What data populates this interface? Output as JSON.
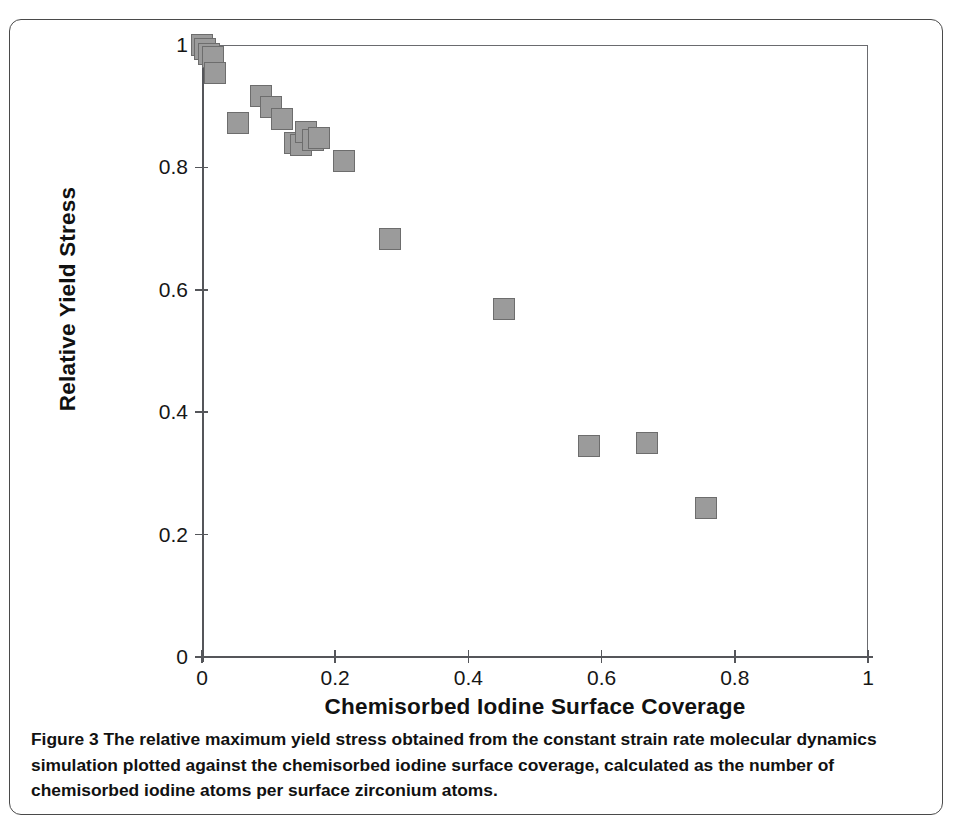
{
  "figure": {
    "caption_label": "Figure 3",
    "caption_text": "The relative maximum yield stress obtained from the constant strain rate molecular dynamics simulation plotted against the chemisorbed iodine surface coverage, calculated as the number of chemisorbed iodine atoms per surface zirconium atoms."
  },
  "chart_data": {
    "type": "scatter",
    "title": "",
    "xlabel": "Chemisorbed Iodine Surface Coverage",
    "ylabel": "Relative Yield Stress",
    "xlim": [
      0,
      1
    ],
    "ylim": [
      0,
      1
    ],
    "xticks": [
      "0",
      "0.2",
      "0.4",
      "0.6",
      "0.8",
      "1"
    ],
    "xtick_values": [
      0,
      0.2,
      0.4,
      0.6,
      0.8,
      1
    ],
    "yticks": [
      "0",
      "0.2",
      "0.4",
      "0.6",
      "0.8",
      "1"
    ],
    "ytick_values": [
      0,
      0.2,
      0.4,
      0.6,
      0.8,
      1
    ],
    "grid": false,
    "legend": "none",
    "marker": "square",
    "marker_color": "#9b9b9b",
    "marker_edge_color": "#6d6d6d",
    "series": [
      {
        "name": "Relative yield stress vs coverage",
        "points": [
          {
            "x": 0.0,
            "y": 1.0
          },
          {
            "x": 0.004,
            "y": 0.993
          },
          {
            "x": 0.01,
            "y": 0.985
          },
          {
            "x": 0.016,
            "y": 0.98
          },
          {
            "x": 0.019,
            "y": 0.955
          },
          {
            "x": 0.054,
            "y": 0.872
          },
          {
            "x": 0.088,
            "y": 0.917
          },
          {
            "x": 0.104,
            "y": 0.898
          },
          {
            "x": 0.12,
            "y": 0.879
          },
          {
            "x": 0.14,
            "y": 0.84
          },
          {
            "x": 0.148,
            "y": 0.836
          },
          {
            "x": 0.156,
            "y": 0.858
          },
          {
            "x": 0.166,
            "y": 0.845
          },
          {
            "x": 0.176,
            "y": 0.848
          },
          {
            "x": 0.213,
            "y": 0.81
          },
          {
            "x": 0.282,
            "y": 0.683
          },
          {
            "x": 0.454,
            "y": 0.568
          },
          {
            "x": 0.581,
            "y": 0.344
          },
          {
            "x": 0.668,
            "y": 0.35
          },
          {
            "x": 0.757,
            "y": 0.243
          }
        ]
      }
    ]
  }
}
